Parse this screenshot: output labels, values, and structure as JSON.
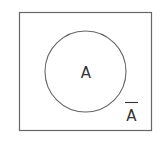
{
  "diagram": {
    "type": "venn",
    "universe": {
      "label": ""
    },
    "sets": [
      {
        "name": "A",
        "label": "A"
      }
    ],
    "complement": {
      "of": "A",
      "label": "A",
      "notation": "overbar"
    },
    "colors": {
      "stroke": "#666666",
      "text": "#333333",
      "background": "#ffffff"
    }
  }
}
